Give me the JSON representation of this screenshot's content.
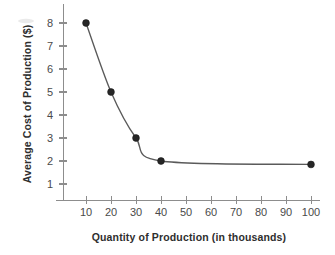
{
  "chart_data": {
    "type": "line",
    "title": "",
    "subtitle": "",
    "xlabel": "Quantity of Production (in thousands)",
    "ylabel": "Average Cost of Production ($)",
    "x": [
      10,
      20,
      30,
      40,
      100
    ],
    "values": [
      8,
      5,
      3,
      2,
      1.85
    ],
    "series": [
      {
        "name": "Average cost of production",
        "x": [
          10,
          20,
          30,
          40,
          100
        ],
        "values": [
          8,
          5,
          3,
          2,
          1.85
        ]
      }
    ],
    "points": [
      {
        "x": 10,
        "y": 8
      },
      {
        "x": 20,
        "y": 5
      },
      {
        "x": 30,
        "y": 3
      },
      {
        "x": 40,
        "y": 2
      },
      {
        "x": 100,
        "y": 1.85
      }
    ],
    "xticks": [
      10,
      20,
      30,
      40,
      50,
      60,
      70,
      80,
      90,
      100
    ],
    "xtick_labels": [
      "10",
      "20",
      "30",
      "40",
      "50",
      "60",
      "70",
      "80",
      "90",
      "100"
    ],
    "yticks": [
      1,
      2,
      3,
      4,
      5,
      6,
      7,
      8
    ],
    "ytick_labels": [
      "1",
      "2",
      "3",
      "4",
      "5",
      "6",
      "7",
      "8"
    ],
    "xlim": [
      2,
      108
    ],
    "ylim": [
      0,
      8.7
    ],
    "grid": false,
    "legend": false,
    "legend_position": "none",
    "annotations": [],
    "marker": "filled-circle",
    "line_color": "#5a5a5a",
    "marker_color": "#262626",
    "axis_color": "#8d8d8d",
    "background_color": "#ffffff"
  },
  "axis_titles": {
    "x": "Quantity of Production (in thousands)",
    "y": "Average Cost of Production ($)"
  },
  "ticks": {
    "x": [
      "10",
      "20",
      "30",
      "40",
      "50",
      "60",
      "70",
      "80",
      "90",
      "100"
    ],
    "y": [
      "1",
      "2",
      "3",
      "4",
      "5",
      "6",
      "7",
      "8"
    ]
  }
}
